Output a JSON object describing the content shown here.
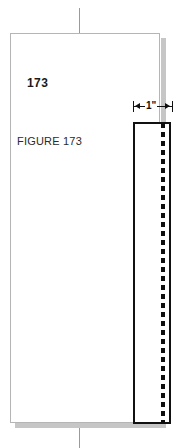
{
  "node": {
    "type": "document-page-thumbnail",
    "connector_top": true,
    "connector_bottom": true
  },
  "page": {
    "number": "173",
    "figure_caption": "FIGURE 173"
  },
  "dimension": {
    "label": "1\"",
    "tick_left_icon": "dimension-tick-icon",
    "tick_right_icon": "dimension-tick-icon",
    "arrow_left_icon": "arrow-left-icon",
    "arrow_right_icon": "arrow-right-icon"
  },
  "drawing": {
    "shape": "tall-rectangle",
    "dashed_line": "vertical-dashed-strip"
  },
  "colors": {
    "page_background": "#ffffff",
    "page_border": "#b5b5b5",
    "page_shadow": "#c6c6c6",
    "connector": "#9a9a9a",
    "ink": "#111111",
    "text": "#1a1a1a"
  }
}
